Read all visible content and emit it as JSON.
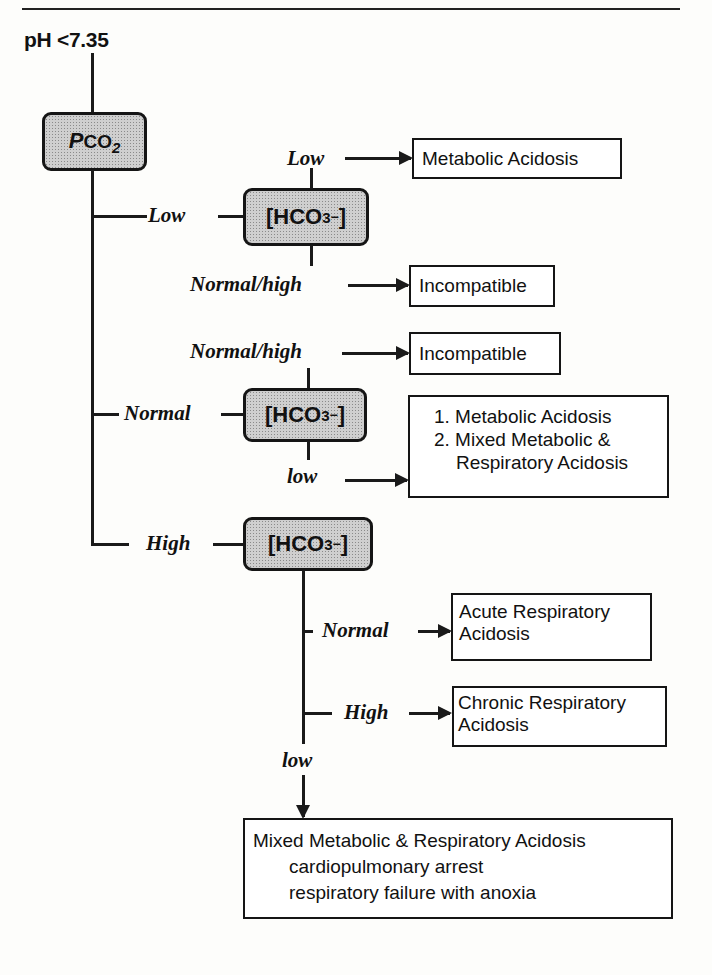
{
  "diagram": {
    "start_condition": "pH <7.35",
    "root_node": {
      "italic_part": "P",
      "text": "CO",
      "subscript": "2"
    },
    "hco3_node": {
      "prefix": "[HCO",
      "subscript": "3",
      "superscript": "−",
      "suffix": "]"
    },
    "branches": [
      {
        "pco2_label": "Low",
        "outcomes": [
          {
            "hco3_label": "Low",
            "result": [
              "Metabolic Acidosis"
            ]
          },
          {
            "hco3_label": "Normal/high",
            "result": [
              "Incompatible"
            ]
          }
        ]
      },
      {
        "pco2_label": "Normal",
        "outcomes": [
          {
            "hco3_label": "Normal/high",
            "result": [
              "Incompatible"
            ]
          },
          {
            "hco3_label": "low",
            "result": [
              "1. Metabolic Acidosis",
              "2. Mixed Metabolic &",
              "Respiratory Acidosis"
            ]
          }
        ]
      },
      {
        "pco2_label": "High",
        "outcomes": [
          {
            "hco3_label": "Normal",
            "result": [
              "Acute Respiratory",
              "Acidosis"
            ]
          },
          {
            "hco3_label": "High",
            "result": [
              "Chronic Respiratory",
              "Acidosis"
            ]
          },
          {
            "hco3_label": "low",
            "result": [
              "Mixed Metabolic & Respiratory Acidosis",
              "cardiopulmonary arrest",
              "respiratory failure with anoxia"
            ]
          }
        ]
      }
    ]
  },
  "colors": {
    "line": "#1a1a1a",
    "node_fill": "#cfcfcf",
    "background": "#fdfdfb"
  }
}
